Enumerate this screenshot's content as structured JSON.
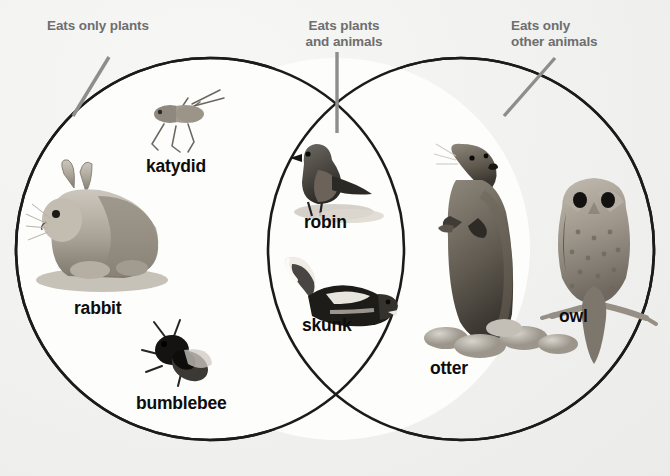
{
  "diagram": {
    "type": "venn",
    "title_labels": {
      "left": "Eats only plants",
      "middle": "Eats plants\nand animals",
      "right": "Eats only\nother animals"
    },
    "sets": [
      {
        "id": "left",
        "label": "Eats only plants",
        "members": [
          "katydid",
          "rabbit",
          "bumblebee"
        ]
      },
      {
        "id": "intersection",
        "label": "Eats plants and animals",
        "members": [
          "robin",
          "skunk"
        ]
      },
      {
        "id": "right",
        "label": "Eats only other animals",
        "members": [
          "otter",
          "owl"
        ]
      }
    ],
    "items": {
      "katydid": "katydid",
      "rabbit": "rabbit",
      "bumblebee": "bumblebee",
      "robin": "robin",
      "skunk": "skunk",
      "otter": "otter",
      "owl": "owl"
    },
    "colors": {
      "background": "#f1f1ef",
      "circle_outline": "#1b1b1b",
      "header_text": "#6e6e6e",
      "item_text": "#0d0d0d",
      "leader_line": "#8d8d8d"
    }
  }
}
